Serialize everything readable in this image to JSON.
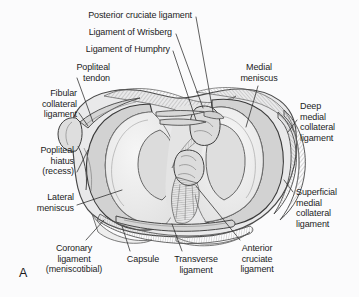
{
  "figure": {
    "panel_letter": "A",
    "background_color": "#fbfbfc",
    "text_color": "#1c1c1c",
    "leader_line_color": "#2b2b2b",
    "outline_color": "#3a3a3a",
    "meniscus_fill": "#d4d4d4",
    "articular_surface_fill": "#eeeeee",
    "capsule_fill": "#e3e3e3"
  },
  "labels": [
    {
      "id": "posterior-cruciate-ligament",
      "text": "Posterior cruciate ligament",
      "align": "right",
      "x": 42,
      "y": 10,
      "width": 150
    },
    {
      "id": "ligament-of-wrisberg",
      "text": "Ligament of Wrisberg",
      "align": "right",
      "x": 42,
      "y": 27,
      "width": 130
    },
    {
      "id": "ligament-of-humphry",
      "text": "Ligament of Humphry",
      "align": "right",
      "x": 32,
      "y": 44,
      "width": 138
    },
    {
      "id": "popliteal-tendon",
      "text": "Popliteal\ntendon",
      "align": "right",
      "x": 48,
      "y": 62,
      "width": 62
    },
    {
      "id": "fibular-collateral-ligament",
      "text": "Fibular\ncollateral\nligament",
      "align": "right",
      "x": 12,
      "y": 88,
      "width": 65
    },
    {
      "id": "popliteal-hiatus-recess",
      "text": "Popliteal\nhiatus\n(recess)",
      "align": "right",
      "x": 10,
      "y": 145,
      "width": 64
    },
    {
      "id": "lateral-meniscus",
      "text": "Lateral\nmeniscus",
      "align": "right",
      "x": 8,
      "y": 192,
      "width": 66
    },
    {
      "id": "medial-meniscus",
      "text": "Medial\nmeniscus",
      "align": "center",
      "x": 228,
      "y": 62,
      "width": 62
    },
    {
      "id": "deep-medial-collateral-ligament",
      "text": "Deep\nmedial\ncollateral\nligament",
      "align": "left",
      "x": 300,
      "y": 101,
      "width": 58
    },
    {
      "id": "superficial-medial-collateral-ligament",
      "text": "Superficial\nmedial\ncollateral\nligament",
      "align": "left",
      "x": 296,
      "y": 187,
      "width": 62
    },
    {
      "id": "coronary-ligament-meniscotibial",
      "text": "Coronary\nligament\n(meniscotibial)",
      "align": "center",
      "x": 33,
      "y": 243,
      "width": 82
    },
    {
      "id": "capsule",
      "text": "Capsule",
      "align": "center",
      "x": 119,
      "y": 254,
      "width": 48
    },
    {
      "id": "transverse-ligament",
      "text": "Transverse\nligament",
      "align": "center",
      "x": 165,
      "y": 254,
      "width": 62
    },
    {
      "id": "anterior-cruciate-ligament",
      "text": "Anterior\ncruciate\nligament",
      "align": "center",
      "x": 228,
      "y": 243,
      "width": 58
    }
  ]
}
